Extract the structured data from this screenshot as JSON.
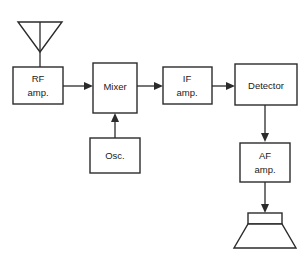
{
  "diagram": {
    "stroke_color": "#2b2b2b",
    "background_color": "#ffffff",
    "blocks": [
      {
        "id": "rf-amp",
        "label_line1": "RF",
        "label_line2": "amp."
      },
      {
        "id": "mixer",
        "label_line1": "Mixer",
        "label_line2": ""
      },
      {
        "id": "if-amp",
        "label_line1": "IF",
        "label_line2": "amp."
      },
      {
        "id": "detector",
        "label_line1": "Detector",
        "label_line2": ""
      },
      {
        "id": "osc",
        "label_line1": "Osc.",
        "label_line2": ""
      },
      {
        "id": "af-amp",
        "label_line1": "AF",
        "label_line2": "amp."
      }
    ],
    "symbols": [
      {
        "id": "antenna",
        "name": "antenna-symbol"
      },
      {
        "id": "speaker",
        "name": "loudspeaker-symbol"
      }
    ],
    "connections": [
      {
        "from": "antenna",
        "to": "rf-amp",
        "arrow": false
      },
      {
        "from": "rf-amp",
        "to": "mixer",
        "arrow": true
      },
      {
        "from": "mixer",
        "to": "if-amp",
        "arrow": true
      },
      {
        "from": "if-amp",
        "to": "detector",
        "arrow": true
      },
      {
        "from": "osc",
        "to": "mixer",
        "arrow": true
      },
      {
        "from": "detector",
        "to": "af-amp",
        "arrow": true
      },
      {
        "from": "af-amp",
        "to": "speaker",
        "arrow": true
      }
    ]
  }
}
